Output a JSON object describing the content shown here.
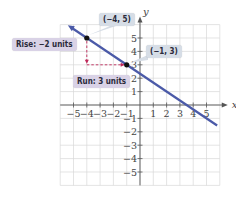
{
  "chart_data": {
    "type": "line",
    "title": "",
    "xlabel": "x",
    "ylabel": "y",
    "xlim": [
      -6,
      6
    ],
    "ylim": [
      -6,
      6
    ],
    "grid": true,
    "x_ticks": [
      -5,
      -4,
      -3,
      -2,
      -1,
      1,
      2,
      3,
      4,
      5
    ],
    "y_ticks": [
      -5,
      -4,
      -3,
      -2,
      -1,
      1,
      2,
      3,
      4,
      5
    ],
    "x_tick_labels": [
      "−5",
      "−4",
      "−3",
      "−2",
      "−1",
      "1",
      "2",
      "3",
      "4",
      "5"
    ],
    "y_tick_labels": [
      "−5",
      "−4",
      "−3",
      "−2",
      "−1",
      "1",
      "2",
      "3",
      "4",
      "5"
    ],
    "series": [
      {
        "name": "line",
        "color": "#4b5aa8",
        "slope": -0.6667,
        "intercept": 2.3333,
        "x": [
          -5.2,
          5.8
        ],
        "y": [
          5.8,
          -1.53
        ]
      }
    ],
    "points": [
      {
        "label": "(−4, 5)",
        "x": -4,
        "y": 5
      },
      {
        "label": "(−1, 3)",
        "x": -1,
        "y": 3
      }
    ],
    "annotations": [
      {
        "text": "Rise: −2 units",
        "type": "vertical-dashed-arrow",
        "from": [
          -4,
          5
        ],
        "to": [
          -4,
          3
        ]
      },
      {
        "text": "Run: 3 units",
        "type": "horizontal-dashed-arrow",
        "from": [
          -4,
          3
        ],
        "to": [
          -1,
          3
        ]
      }
    ]
  },
  "labels": {
    "point_a": "(−4, 5)",
    "point_b": "(−1, 3)",
    "rise": "Rise: −2 units",
    "run": "Run: 3 units",
    "x_axis": "x",
    "y_axis": "y"
  },
  "colors": {
    "line": "#4b5aa8",
    "dash": "#c0285a",
    "grid": "#d8d8d8",
    "axis": "#555555",
    "label_bg": "#d9d2e6"
  }
}
